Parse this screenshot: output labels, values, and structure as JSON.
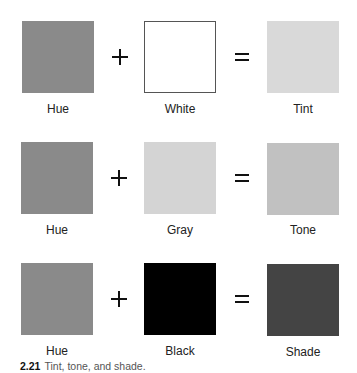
{
  "rows": [
    {
      "operand1": {
        "label": "Hue",
        "color": "#8a8a8a"
      },
      "operator1": "+",
      "operand2": {
        "label": "White",
        "color": "#ffffff",
        "outlined": true
      },
      "operator2": "=",
      "result": {
        "label": "Tint",
        "color": "#d9d9d9"
      }
    },
    {
      "operand1": {
        "label": "Hue",
        "color": "#8a8a8a"
      },
      "operator1": "+",
      "operand2": {
        "label": "Gray",
        "color": "#d4d4d4"
      },
      "operator2": "=",
      "result": {
        "label": "Tone",
        "color": "#c1c1c1"
      }
    },
    {
      "operand1": {
        "label": "Hue",
        "color": "#8a8a8a"
      },
      "operator1": "+",
      "operand2": {
        "label": "Black",
        "color": "#000000"
      },
      "operator2": "=",
      "result": {
        "label": "Shade",
        "color": "#444444"
      }
    }
  ],
  "caption": {
    "number": "2.21",
    "text": "Tint, tone, and shade."
  }
}
